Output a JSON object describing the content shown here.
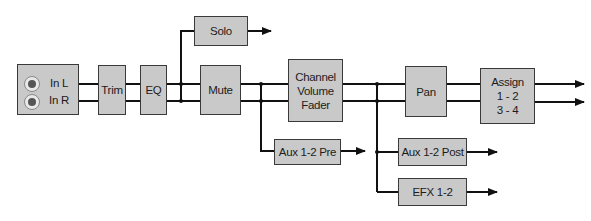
{
  "diagram": {
    "type": "signal-flow",
    "colors": {
      "block_fill": "#c9c9c9",
      "line": "#111111",
      "background": "#ffffff"
    },
    "input": {
      "channels": [
        {
          "label": "In L",
          "icon": "jack-icon"
        },
        {
          "label": "In R",
          "icon": "jack-icon"
        }
      ]
    },
    "blocks": {
      "trim": "Trim",
      "eq": "EQ",
      "solo": "Solo",
      "mute": "Mute",
      "fader": "Channel\nVolume\nFader",
      "pan": "Pan",
      "assign": "Assign\n1 - 2\n3 - 4",
      "aux_pre": "Aux 1-2 Pre",
      "aux_post": "Aux 1-2 Post",
      "efx": "EFX 1-2"
    },
    "connections": [
      [
        "Input",
        "Trim"
      ],
      [
        "Trim",
        "EQ"
      ],
      [
        "EQ",
        "Mute"
      ],
      [
        "EQ",
        "Solo"
      ],
      [
        "Mute",
        "Channel Volume Fader"
      ],
      [
        "Mute",
        "Aux 1-2 Pre"
      ],
      [
        "Channel Volume Fader",
        "Pan"
      ],
      [
        "Channel Volume Fader",
        "Aux 1-2 Post"
      ],
      [
        "Channel Volume Fader",
        "EFX 1-2"
      ],
      [
        "Pan",
        "Assign"
      ]
    ]
  }
}
